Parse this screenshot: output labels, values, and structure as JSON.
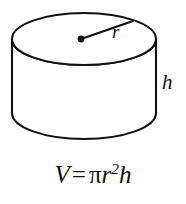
{
  "figure": {
    "name": "cylinder-volume-diagram",
    "shape": "cylinder",
    "background_color": "#ffffff",
    "stroke_color": "#111111",
    "fill_color": "#ffffff",
    "labels": {
      "radius": "r",
      "height": "h"
    },
    "geometry": {
      "top_ellipse_center_x": 84,
      "top_ellipse_center_y": 39,
      "top_ellipse_rx": 72,
      "top_ellipse_ry": 26,
      "body_height": 74,
      "left_edge_x": 12,
      "right_edge_x": 156,
      "bottom_center_y": 113,
      "center_dot_x": 81,
      "center_dot_y": 39,
      "radius_line_end_x": 133,
      "radius_line_end_y": 21
    }
  },
  "formula": {
    "volume_symbol": "V",
    "equals": "=",
    "pi": "π",
    "radius_symbol": "r",
    "exponent": "2",
    "height_symbol": "h",
    "full_text": "V = πr²h"
  }
}
